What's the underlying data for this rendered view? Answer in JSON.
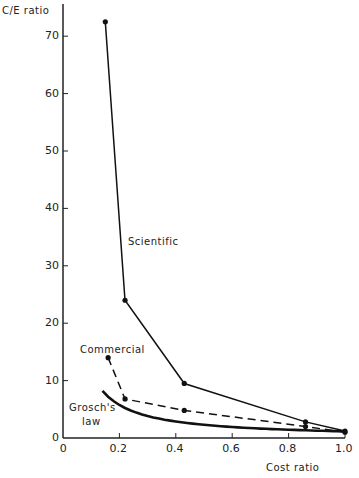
{
  "chart_data": {
    "type": "line",
    "title": "",
    "xlabel": "Cost ratio",
    "ylabel": "C/E ratio",
    "xlim": [
      0,
      1.0
    ],
    "ylim": [
      0,
      75
    ],
    "grid": false,
    "x_ticks": [
      "0",
      "0.2",
      "0.4",
      "0.6",
      "0.8",
      "1.0"
    ],
    "y_ticks": [
      "0",
      "10",
      "20",
      "30",
      "40",
      "50",
      "60",
      "70"
    ],
    "series": [
      {
        "name": "Scientific",
        "style": "solid",
        "markers": true,
        "x": [
          0.15,
          0.22,
          0.43,
          0.86,
          1.0
        ],
        "y": [
          72.5,
          24,
          9.5,
          2.8,
          1.2
        ]
      },
      {
        "name": "Commercial",
        "style": "dashed",
        "markers": true,
        "x": [
          0.16,
          0.22,
          0.43,
          0.86,
          1.0
        ],
        "y": [
          14,
          6.8,
          4.8,
          2.0,
          1.0
        ]
      },
      {
        "name": "Grosch's law",
        "style": "solid-thick",
        "markers": false,
        "x": [
          0.14,
          0.2,
          0.3,
          0.43,
          0.6,
          0.8,
          1.0
        ],
        "y": [
          8.2,
          5.8,
          3.9,
          2.8,
          2.0,
          1.5,
          1.2
        ]
      }
    ],
    "annotations": [
      "Scientific",
      "Commercial",
      "Grosch's law"
    ]
  },
  "labels": {
    "ylabel": "C/E ratio",
    "xlabel": "Cost ratio",
    "scientific": "Scientific",
    "commercial": "Commercial",
    "grosch1": "Grosch's",
    "grosch2": "law"
  }
}
